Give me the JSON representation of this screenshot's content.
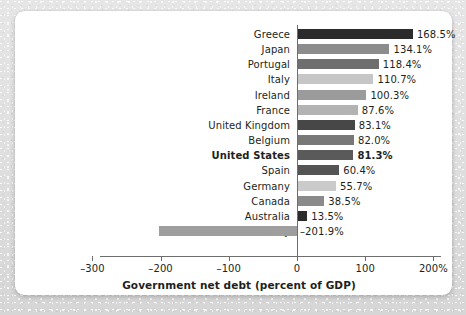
{
  "chart_data": {
    "type": "bar",
    "orientation": "horizontal",
    "title": "",
    "xlabel": "Government net debt (percent of GDP)",
    "ylabel": "",
    "xlim": [
      -300,
      200
    ],
    "xticks": [
      -300,
      -200,
      -100,
      0,
      100,
      200
    ],
    "xticklabels": [
      "–300",
      "–200",
      "–100",
      "0",
      "100",
      "200%"
    ],
    "grid": false,
    "legend": null,
    "categories": [
      "Greece",
      "Japan",
      "Portugal",
      "Italy",
      "Ireland",
      "France",
      "United Kingdom",
      "Belgium",
      "United States",
      "Spain",
      "Germany",
      "Canada",
      "Australia",
      "Norway"
    ],
    "values": [
      168.5,
      134.1,
      118.4,
      110.7,
      100.3,
      87.6,
      83.1,
      82.0,
      81.3,
      60.4,
      55.7,
      38.5,
      13.5,
      -201.9
    ],
    "value_labels": [
      "168.5%",
      "134.1%",
      "118.4%",
      "110.7%",
      "100.3%",
      "87.6%",
      "83.1%",
      "82.0%",
      "81.3%",
      "60.4%",
      "55.7%",
      "38.5%",
      "13.5%",
      "–201.9%"
    ],
    "bar_colors": [
      "#2b2b2b",
      "#8c8c8c",
      "#6e6e6e",
      "#c6c6c6",
      "#9b9b9b",
      "#b3b3b3",
      "#474747",
      "#787878",
      "#5a5a5a",
      "#545454",
      "#cacaca",
      "#8a8a8a",
      "#2b2b2b",
      "#9e9e9e"
    ],
    "highlight_category": "United States",
    "axis_color": "#6e6e6e",
    "text_color": "#231f20",
    "background_color": "#ffffff"
  }
}
